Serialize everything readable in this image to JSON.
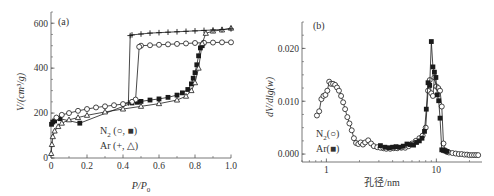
{
  "chart_data": [
    {
      "panel": "(a)",
      "type": "scatter",
      "xlabel": "P/P0",
      "ylabel": "V/(cm3/g)",
      "xlim": [
        0,
        1.0
      ],
      "ylim": [
        0,
        650
      ],
      "xticks": [
        0,
        0.2,
        0.4,
        0.6,
        0.8,
        1.0
      ],
      "xtick_labels": [
        "0",
        "0.2",
        "0.4",
        "0.6",
        "0.8",
        "1.0"
      ],
      "yticks": [
        0,
        200,
        400,
        600
      ],
      "ytick_labels": [
        "0",
        "200",
        "400",
        "600"
      ],
      "legend": [
        "N2 (○, ■)",
        "Ar (+, △)"
      ],
      "series": [
        {
          "name": "N2 adsorption",
          "marker": "filled-square",
          "x": [
            0.003,
            0.01,
            0.02,
            0.05,
            0.16,
            0.45,
            0.48,
            0.5,
            0.55,
            0.6,
            0.65,
            0.7,
            0.73,
            0.76,
            0.78,
            0.79,
            0.8,
            0.81,
            0.82,
            0.83,
            0.84
          ],
          "y": [
            150,
            160,
            165,
            175,
            155,
            245,
            248,
            252,
            258,
            263,
            270,
            280,
            290,
            305,
            330,
            355,
            380,
            415,
            455,
            490,
            500
          ]
        },
        {
          "name": "N2 desorption",
          "marker": "open-circle",
          "x": [
            1.0,
            0.95,
            0.9,
            0.85,
            0.8,
            0.75,
            0.7,
            0.65,
            0.6,
            0.55,
            0.5,
            0.49,
            0.47,
            0.45,
            0.4,
            0.35,
            0.3,
            0.25,
            0.2,
            0.15,
            0.1,
            0.06,
            0.03
          ],
          "y": [
            515,
            515,
            514,
            513,
            512,
            510,
            508,
            506,
            504,
            502,
            500,
            495,
            260,
            250,
            240,
            235,
            230,
            225,
            218,
            210,
            200,
            192,
            180
          ]
        },
        {
          "name": "Ar adsorption",
          "marker": "open-triangle",
          "x": [
            0.001,
            0.005,
            0.01,
            0.02,
            0.04,
            0.06,
            0.1,
            0.15,
            0.2,
            0.3,
            0.4,
            0.5,
            0.6,
            0.7,
            0.75,
            0.78,
            0.8,
            0.82,
            0.84,
            0.86,
            0.9,
            0.95,
            1.0
          ],
          "y": [
            20,
            60,
            95,
            120,
            140,
            155,
            170,
            180,
            190,
            205,
            218,
            230,
            242,
            258,
            275,
            300,
            335,
            400,
            510,
            555,
            565,
            570,
            578
          ]
        },
        {
          "name": "Ar desorption",
          "marker": "plus",
          "x": [
            1.0,
            0.95,
            0.9,
            0.85,
            0.8,
            0.75,
            0.7,
            0.65,
            0.6,
            0.55,
            0.5,
            0.45,
            0.44,
            0.43
          ],
          "y": [
            575,
            572,
            570,
            568,
            566,
            564,
            562,
            560,
            558,
            556,
            552,
            548,
            545,
            245
          ]
        }
      ]
    },
    {
      "panel": "(b)",
      "type": "line",
      "xlabel": "孔径/nm",
      "ylabel": "dV/dlg(w)",
      "xscale": "log",
      "xlim": [
        0.6,
        26
      ],
      "ylim": [
        -0.0015,
        0.025
      ],
      "xticks": [
        1,
        10
      ],
      "xtick_labels": [
        "1",
        "10"
      ],
      "yticks": [
        0.0,
        0.01,
        0.02
      ],
      "ytick_labels": [
        "0.000",
        "0.010",
        "0.020"
      ],
      "legend": [
        "N2(○)",
        "Ar(■)"
      ],
      "series": [
        {
          "name": "N2",
          "marker": "open-circle",
          "x": [
            0.82,
            0.86,
            0.9,
            0.94,
            0.98,
            1.02,
            1.06,
            1.1,
            1.15,
            1.2,
            1.25,
            1.3,
            1.36,
            1.42,
            1.48,
            1.55,
            1.62,
            1.7,
            1.78,
            1.86,
            1.95,
            2.05,
            2.15,
            2.25,
            2.4,
            2.55,
            2.7,
            2.9,
            3.1,
            3.3,
            3.5,
            3.8,
            4.1,
            4.4,
            4.8,
            5.2,
            5.6,
            6.0,
            6.5,
            7.0,
            7.5,
            8.0,
            8.4,
            8.7,
            9.0,
            9.3,
            9.6,
            10.0,
            10.4,
            10.8,
            11.2,
            11.6,
            12.0,
            12.5,
            13.0,
            14,
            15,
            16,
            17,
            18,
            19,
            20,
            21,
            22,
            23,
            24
          ],
          "y": [
            0.0073,
            0.0081,
            0.0104,
            0.011,
            0.0112,
            0.012,
            0.0137,
            0.0133,
            0.0133,
            0.0131,
            0.0126,
            0.012,
            0.011,
            0.0098,
            0.0085,
            0.007,
            0.0058,
            0.0045,
            0.003,
            0.0021,
            0.0019,
            0.0022,
            0.0018,
            0.0022,
            0.0026,
            0.002,
            0.0015,
            0.0013,
            0.0012,
            0.0011,
            0.001,
            0.001,
            0.0011,
            0.0011,
            0.0012,
            0.0012,
            0.0015,
            0.002,
            0.0025,
            0.003,
            0.0035,
            0.005,
            0.012,
            0.014,
            0.0115,
            0.011,
            0.0145,
            0.0128,
            0.0125,
            0.012,
            0.009,
            0.002,
            0.0007,
            0.0004,
            0.0003,
            0.0002,
            0.0001,
            0.0,
            0.0,
            -0.0001,
            -0.0001,
            -0.0002,
            -0.0002,
            -0.0002,
            -0.0002,
            -0.0002
          ],
          "annotations": []
        },
        {
          "name": "Ar",
          "marker": "filled-square",
          "x": [
            3.1,
            3.4,
            3.7,
            4.0,
            4.3,
            4.6,
            5.0,
            5.4,
            5.8,
            6.2,
            6.6,
            7.0,
            7.4,
            7.8,
            8.1,
            8.4,
            8.7,
            9.0,
            9.3,
            9.6,
            9.9,
            10.2,
            10.5,
            10.8,
            11.2,
            11.6,
            12.0,
            12.5
          ],
          "y": [
            0.0016,
            0.0013,
            0.0012,
            0.0013,
            0.0014,
            0.0013,
            0.0015,
            0.0019,
            0.0018,
            0.0017,
            0.0022,
            0.0025,
            0.003,
            0.0043,
            0.0085,
            0.0135,
            0.013,
            0.0213,
            0.0165,
            0.0155,
            0.0145,
            0.0112,
            0.0101,
            0.0068,
            0.0008,
            0.0007,
            0.0006,
            0.0005
          ]
        }
      ]
    }
  ],
  "panels": {
    "a": {
      "label": "(a)",
      "xlabel_main": "P",
      "xlabel_slash": "/",
      "xlabel_sub_base": "P",
      "xlabel_sub": "0",
      "ylabel": "V/(cm³/g)",
      "legend": {
        "line1_pre": "N",
        "line1_sub": "2",
        "line1_post": " (○, ■)",
        "line2": "Ar (+, △)"
      }
    },
    "b": {
      "label": "(b)",
      "xlabel": "孔径/nm",
      "ylabel": "dV/dlg(w)",
      "legend": {
        "line1_pre": "N",
        "line1_sub": "2",
        "line1_post": "(○)",
        "line2": "Ar(■)"
      }
    }
  },
  "colors": {
    "axis": "#555555",
    "series": "#1a1a1a",
    "text": "#333333",
    "background": "#ffffff"
  }
}
